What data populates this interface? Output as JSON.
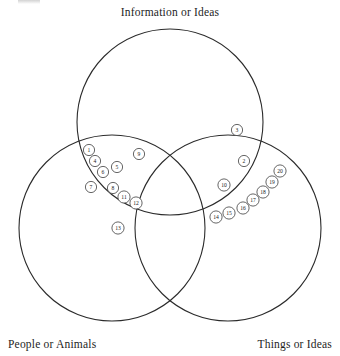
{
  "diagram": {
    "type": "venn",
    "title_top": "Information or Ideas",
    "title_bottom_left": "People or Animals",
    "title_bottom_right": "Things or Ideas",
    "stroke_color": "#2b2b2b",
    "marker_stroke_color": "#4a4a4a",
    "background_color": "#ffffff",
    "text_color": "#1d1d1d"
  },
  "sets": [
    {
      "id": "information",
      "label": "Information or Ideas",
      "cx": 170,
      "cy": 122,
      "r": 93
    },
    {
      "id": "people",
      "label": "People or Animals",
      "cx": 112,
      "cy": 228,
      "r": 93
    },
    {
      "id": "things",
      "label": "Things or Ideas",
      "cx": 228,
      "cy": 228,
      "r": 93
    }
  ],
  "labels": [
    {
      "name": "label-information",
      "text": "Information or Ideas",
      "x": 170,
      "y": 16,
      "anchor": "middle"
    },
    {
      "name": "label-people",
      "text": "People or Animals",
      "x": 8,
      "y": 348,
      "anchor": "start"
    },
    {
      "name": "label-things",
      "text": "Things or Ideas",
      "x": 332,
      "y": 348,
      "anchor": "end"
    }
  ],
  "markers": [
    {
      "id": 1,
      "label": "1",
      "x": 89,
      "y": 150,
      "region": "people-information"
    },
    {
      "id": 4,
      "label": "4",
      "x": 95,
      "y": 161,
      "region": "people-information"
    },
    {
      "id": 5,
      "label": "5",
      "x": 117,
      "y": 167,
      "region": "people-information"
    },
    {
      "id": 6,
      "label": "6",
      "x": 103,
      "y": 172,
      "region": "people-information"
    },
    {
      "id": 7,
      "label": "7",
      "x": 91,
      "y": 187,
      "region": "people-information"
    },
    {
      "id": 8,
      "label": "8",
      "x": 113,
      "y": 188,
      "region": "people-information"
    },
    {
      "id": 9,
      "label": "9",
      "x": 139,
      "y": 154,
      "region": "people-information"
    },
    {
      "id": 11,
      "label": "11",
      "x": 124,
      "y": 197,
      "region": "people-information"
    },
    {
      "id": 12,
      "label": "12",
      "x": 136,
      "y": 203,
      "region": "people-information"
    },
    {
      "id": 13,
      "label": "13",
      "x": 118,
      "y": 228,
      "region": "people"
    },
    {
      "id": 3,
      "label": "3",
      "x": 237,
      "y": 130,
      "region": "information"
    },
    {
      "id": 2,
      "label": "2",
      "x": 244,
      "y": 161,
      "region": "information-things"
    },
    {
      "id": 10,
      "label": "10",
      "x": 224,
      "y": 185,
      "region": "information-things"
    },
    {
      "id": 20,
      "label": "20",
      "x": 280,
      "y": 171,
      "region": "things"
    },
    {
      "id": 19,
      "label": "19",
      "x": 272,
      "y": 182,
      "region": "things"
    },
    {
      "id": 18,
      "label": "18",
      "x": 263,
      "y": 192,
      "region": "things"
    },
    {
      "id": 17,
      "label": "17",
      "x": 253,
      "y": 200,
      "region": "things"
    },
    {
      "id": 16,
      "label": "16",
      "x": 243,
      "y": 208,
      "region": "things"
    },
    {
      "id": 15,
      "label": "15",
      "x": 229,
      "y": 213,
      "region": "things"
    },
    {
      "id": 14,
      "label": "14",
      "x": 216,
      "y": 217,
      "region": "things"
    }
  ]
}
